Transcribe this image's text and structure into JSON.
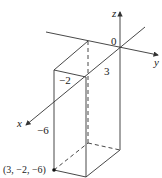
{
  "figure": {
    "axes": {
      "x_label": "x",
      "y_label": "y",
      "z_label": "z",
      "origin_label": "0"
    },
    "dimensions": {
      "x_length": "3",
      "y_length": "−2",
      "z_length": "−6"
    },
    "corner_point_label": "(3, −2, −6)",
    "colors": {
      "line": "#333333",
      "background": "#ffffff"
    }
  }
}
